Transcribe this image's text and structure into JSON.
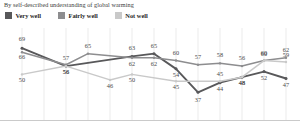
{
  "title": "By self-described understanding of global warming",
  "legend": {
    "position": "top-left",
    "items": [
      {
        "label": "Very well",
        "color": "#58585a",
        "name": "legend-very-well"
      },
      {
        "label": "Fairly well",
        "color": "#8d8d8f",
        "name": "legend-fairly-well"
      },
      {
        "label": "Not well",
        "color": "#c9c9c9",
        "name": "legend-not-well"
      }
    ]
  },
  "chart_data": {
    "type": "line",
    "title": "By self-described understanding of global warming",
    "xlabel": "",
    "ylabel": "",
    "ylim": [
      30,
      72
    ],
    "grid": "vertical",
    "categories": [
      "1",
      "2",
      "3",
      "4",
      "5",
      "6",
      "7",
      "8",
      "9",
      "10",
      "11",
      "12",
      "13"
    ],
    "series": [
      {
        "name": "Very well",
        "color": "#58585a",
        "points": [
          {
            "x": 0,
            "y": 69,
            "label": "69",
            "lx": 0,
            "ly": -7
          },
          {
            "x": 2,
            "y": 56,
            "label": "56",
            "lx": 0,
            "ly": 8
          },
          {
            "x": 5,
            "y": 63,
            "label": "63",
            "lx": 0,
            "ly": -6
          },
          {
            "x": 6,
            "y": 65,
            "label": "65",
            "lx": 0,
            "ly": -6
          },
          {
            "x": 7,
            "y": 54,
            "label": "54",
            "lx": 0,
            "ly": 8
          },
          {
            "x": 8,
            "y": 37,
            "label": "37",
            "lx": 0,
            "ly": 10
          },
          {
            "x": 9,
            "y": 44,
            "label": "44",
            "lx": 0,
            "ly": 8
          },
          {
            "x": 10,
            "y": 48,
            "label": "48",
            "lx": 0,
            "ly": 8
          },
          {
            "x": 11,
            "y": 52,
            "label": "52",
            "lx": 0,
            "ly": 8
          },
          {
            "x": 12,
            "y": 47,
            "label": "47",
            "lx": 0,
            "ly": 8
          }
        ]
      },
      {
        "name": "Fairly well",
        "color": "#8d8d8f",
        "points": [
          {
            "x": 0,
            "y": 66,
            "label": "66",
            "lx": 0,
            "ly": 7
          },
          {
            "x": 2,
            "y": 57,
            "label": "57",
            "lx": 0,
            "ly": -5
          },
          {
            "x": 3,
            "y": 65,
            "label": "65",
            "lx": 0,
            "ly": -6
          },
          {
            "x": 5,
            "y": 62,
            "label": "62",
            "lx": 0,
            "ly": 8
          },
          {
            "x": 6,
            "y": 62,
            "label": "62",
            "lx": 0,
            "ly": 8
          },
          {
            "x": 7,
            "y": 60,
            "label": "60",
            "lx": 0,
            "ly": -6
          },
          {
            "x": 8,
            "y": 57,
            "label": "57",
            "lx": 0,
            "ly": -6
          },
          {
            "x": 9,
            "y": 58,
            "label": "58",
            "lx": 0,
            "ly": -6
          },
          {
            "x": 10,
            "y": 56,
            "label": "56",
            "lx": 0,
            "ly": -6
          },
          {
            "x": 11,
            "y": 60,
            "label": "60",
            "lx": 0,
            "ly": -6
          },
          {
            "x": 12,
            "y": 62,
            "label": "62",
            "lx": 0,
            "ly": -6
          }
        ]
      },
      {
        "name": "Not well",
        "color": "#c9c9c9",
        "points": [
          {
            "x": 0,
            "y": 50,
            "label": "50",
            "lx": 0,
            "ly": 8
          },
          {
            "x": 2,
            "y": 56,
            "label": "56",
            "lx": 0,
            "ly": 8
          },
          {
            "x": 4,
            "y": 46,
            "label": "46",
            "lx": 0,
            "ly": 8
          },
          {
            "x": 5,
            "y": 50,
            "label": "50",
            "lx": 0,
            "ly": 8
          },
          {
            "x": 7,
            "y": 45,
            "label": "45",
            "lx": 0,
            "ly": 8
          },
          {
            "x": 9,
            "y": 45,
            "label": "45",
            "lx": 0,
            "ly": -5
          },
          {
            "x": 10,
            "y": 48,
            "label": "48",
            "lx": 0,
            "ly": 8
          },
          {
            "x": 11,
            "y": 60,
            "label": "60",
            "lx": 0,
            "ly": -5
          },
          {
            "x": 12,
            "y": 59,
            "label": "59",
            "lx": 0,
            "ly": -5
          }
        ]
      }
    ]
  }
}
